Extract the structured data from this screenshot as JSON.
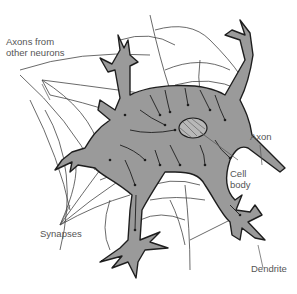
{
  "diagram": {
    "colors": {
      "background": "#ffffff",
      "cell_fill": "#9a9a9a",
      "outline": "#1e1e1e",
      "text": "#555555",
      "fiber": "#444444"
    },
    "labels": {
      "axons_from_other_neurons_line1": "Axons from",
      "axons_from_other_neurons_line2": "other neurons",
      "axon": "Axon",
      "cell_body_line1": "Cell",
      "cell_body_line2": "body",
      "synapses": "Synapses",
      "dendrite": "Dendrite"
    }
  }
}
